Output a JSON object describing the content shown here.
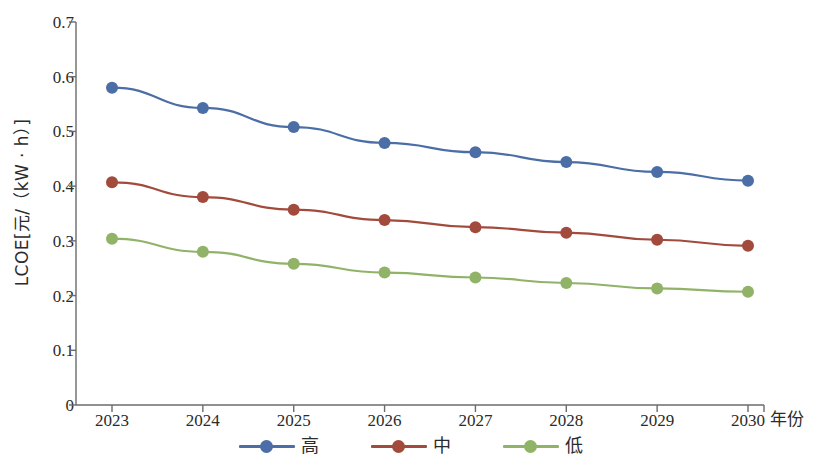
{
  "chart_data": {
    "type": "line",
    "title": "",
    "xlabel": "年份",
    "ylabel": "LCOE[元/（kW · h）]",
    "categories": [
      "2023",
      "2024",
      "2025",
      "2026",
      "2027",
      "2028",
      "2029",
      "2030"
    ],
    "x": [
      2023,
      2024,
      2025,
      2026,
      2027,
      2028,
      2029,
      2030
    ],
    "series": [
      {
        "name": "高",
        "color": "#4a6ea5",
        "values": [
          0.58,
          0.543,
          0.508,
          0.479,
          0.462,
          0.444,
          0.426,
          0.41
        ]
      },
      {
        "name": "中",
        "color": "#a24a3c",
        "values": [
          0.407,
          0.38,
          0.357,
          0.338,
          0.325,
          0.315,
          0.302,
          0.291
        ]
      },
      {
        "name": "低",
        "color": "#90b368",
        "values": [
          0.304,
          0.28,
          0.258,
          0.242,
          0.233,
          0.223,
          0.213,
          0.207
        ]
      }
    ],
    "ylim": [
      0,
      0.7
    ],
    "yticks": [
      0,
      0.1,
      0.2,
      0.3,
      0.4,
      0.5,
      0.6,
      0.7
    ],
    "ytick_labels": [
      "0",
      "0.1",
      "0.2",
      "0.3",
      "0.4",
      "0.5",
      "0.6",
      "0.7"
    ],
    "grid": false,
    "legend_position": "bottom",
    "legend_entries": [
      "高",
      "中",
      "低"
    ],
    "marker": "circle"
  },
  "axes": {
    "y_title": "LCOE[元/（kW · h）]",
    "x_title": "年份"
  }
}
